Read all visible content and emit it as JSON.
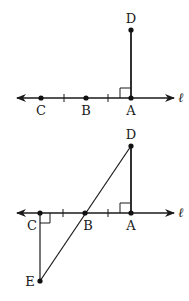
{
  "colors": {
    "ink": "#1a1a1a",
    "background": "#ffffff"
  },
  "figure1": {
    "line_label": "ℓ",
    "points": {
      "C": {
        "label": "C"
      },
      "B": {
        "label": "B"
      },
      "A": {
        "label": "A"
      },
      "D": {
        "label": "D"
      }
    },
    "right_angle_at": "A",
    "congruence_ticks": 2
  },
  "figure2": {
    "line_label": "ℓ",
    "points": {
      "C": {
        "label": "C"
      },
      "B": {
        "label": "B"
      },
      "A": {
        "label": "A"
      },
      "D": {
        "label": "D"
      },
      "E": {
        "label": "E"
      }
    },
    "right_angles_at": [
      "A",
      "C"
    ],
    "segments": [
      "DA",
      "EC",
      "DE"
    ],
    "congruence_ticks": 2
  }
}
